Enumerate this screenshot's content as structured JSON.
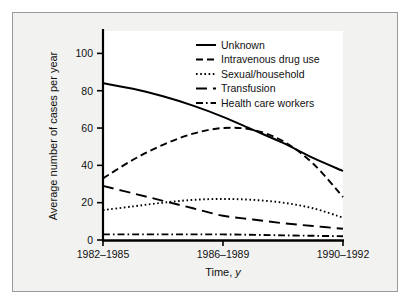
{
  "figure": {
    "background_color": "#f2f2f0",
    "frame_color": "#9a9a9a",
    "plot_background": "#ffffff",
    "axis_color": "#000000"
  },
  "chart_data": {
    "type": "line",
    "title": "",
    "xlabel_text": "Time, ",
    "xlabel_italic": "y",
    "ylabel": "Average number of cases per year",
    "categories": [
      "1982–1985",
      "1986–1989",
      "1990–1992"
    ],
    "xtick_labels": [
      "1982–1985",
      "1986–1989",
      "1990–1992"
    ],
    "ytick_labels": [
      "0",
      "20",
      "40",
      "60",
      "80",
      "100"
    ],
    "ytick_values": [
      0,
      20,
      40,
      60,
      80,
      100
    ],
    "ylim": [
      0,
      112
    ],
    "xlim": [
      0,
      2
    ],
    "grid": false,
    "legend_position": "top-right-inside",
    "series": [
      {
        "name": "Unknown",
        "line_style": "solid",
        "color": "#000000",
        "values": [
          84,
          66,
          37
        ],
        "points": [
          {
            "x": 0.0,
            "y": 84
          },
          {
            "x": 0.25,
            "y": 81
          },
          {
            "x": 0.5,
            "y": 77
          },
          {
            "x": 0.75,
            "y": 72
          },
          {
            "x": 1.0,
            "y": 66
          },
          {
            "x": 1.25,
            "y": 59
          },
          {
            "x": 1.5,
            "y": 52
          },
          {
            "x": 1.75,
            "y": 44
          },
          {
            "x": 2.0,
            "y": 37
          }
        ]
      },
      {
        "name": "Intravenous drug use",
        "line_style": "dashed",
        "color": "#000000",
        "values": [
          33,
          60,
          23
        ],
        "points": [
          {
            "x": 0.0,
            "y": 33
          },
          {
            "x": 0.25,
            "y": 43
          },
          {
            "x": 0.5,
            "y": 51
          },
          {
            "x": 0.75,
            "y": 57
          },
          {
            "x": 1.0,
            "y": 60
          },
          {
            "x": 1.25,
            "y": 59
          },
          {
            "x": 1.5,
            "y": 53
          },
          {
            "x": 1.75,
            "y": 41
          },
          {
            "x": 2.0,
            "y": 23
          }
        ]
      },
      {
        "name": "Sexual/household",
        "line_style": "dotted",
        "color": "#000000",
        "values": [
          16,
          22,
          12
        ],
        "points": [
          {
            "x": 0.0,
            "y": 16
          },
          {
            "x": 0.25,
            "y": 18
          },
          {
            "x": 0.5,
            "y": 20
          },
          {
            "x": 0.75,
            "y": 21.5
          },
          {
            "x": 1.0,
            "y": 22
          },
          {
            "x": 1.25,
            "y": 21.5
          },
          {
            "x": 1.5,
            "y": 20
          },
          {
            "x": 1.75,
            "y": 17
          },
          {
            "x": 2.0,
            "y": 12
          }
        ]
      },
      {
        "name": "Transfusion",
        "line_style": "long-dashed",
        "color": "#000000",
        "values": [
          29,
          13,
          6
        ],
        "points": [
          {
            "x": 0.0,
            "y": 29
          },
          {
            "x": 0.25,
            "y": 25
          },
          {
            "x": 0.5,
            "y": 21
          },
          {
            "x": 0.75,
            "y": 17
          },
          {
            "x": 1.0,
            "y": 13
          },
          {
            "x": 1.25,
            "y": 11
          },
          {
            "x": 1.5,
            "y": 9
          },
          {
            "x": 1.75,
            "y": 7.5
          },
          {
            "x": 2.0,
            "y": 6
          }
        ]
      },
      {
        "name": "Health care workers",
        "line_style": "dash-dot",
        "color": "#000000",
        "values": [
          3,
          3,
          2
        ],
        "points": [
          {
            "x": 0.0,
            "y": 3
          },
          {
            "x": 0.5,
            "y": 3
          },
          {
            "x": 1.0,
            "y": 3
          },
          {
            "x": 1.5,
            "y": 2.5
          },
          {
            "x": 2.0,
            "y": 2
          }
        ]
      }
    ],
    "legend_entries": [
      {
        "label": "Unknown",
        "line_style": "solid"
      },
      {
        "label": "Intravenous drug use",
        "line_style": "dashed"
      },
      {
        "label": "Sexual/household",
        "line_style": "dotted"
      },
      {
        "label": "Transfusion",
        "line_style": "long-dashed"
      },
      {
        "label": "Health care workers",
        "line_style": "dash-dot"
      }
    ]
  }
}
